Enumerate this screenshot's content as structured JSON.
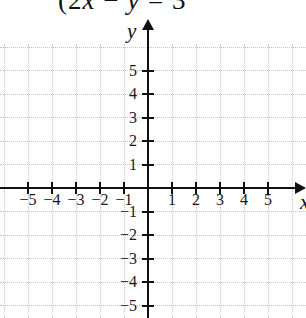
{
  "caption": {
    "full_text": "(2x − y = 3",
    "parts": [
      {
        "text": "(2",
        "italic": false
      },
      {
        "text": "x",
        "italic": true
      },
      {
        "text": " − ",
        "italic": false
      },
      {
        "text": "y",
        "italic": true
      },
      {
        "text": " = 3",
        "italic": false
      }
    ]
  },
  "chart_data": {
    "type": "scatter",
    "title": "(2x − y = 3",
    "series": [],
    "xlabel": "x",
    "ylabel": "y",
    "xlim": [
      -6.2,
      6.6
    ],
    "ylim": [
      -5.6,
      7.0
    ],
    "x_ticks": [
      -5,
      -4,
      -3,
      -2,
      -1,
      1,
      2,
      3,
      4,
      5
    ],
    "y_ticks": [
      5,
      4,
      3,
      2,
      1,
      -1,
      -2,
      -3,
      -4,
      -5
    ],
    "grid": "dotted",
    "legend": "none"
  },
  "colors": {
    "background": "#ffffff",
    "axis": "#111111",
    "grid": "#c3c3c3",
    "text": "#1a1a1a"
  }
}
